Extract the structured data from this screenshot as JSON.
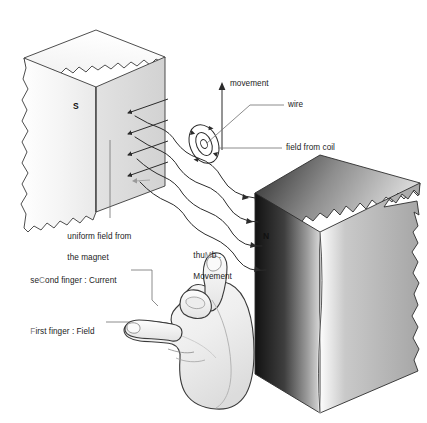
{
  "diagram": {
    "background_color": "#ffffff",
    "ink_color": "#2b2b2b",
    "text_color": "#1c1c1c",
    "highlight_letter_color": "#7d7d7d"
  },
  "magnets": {
    "south": {
      "pole_label": "S",
      "face_color": "#f2f2f2",
      "top_color": "#fbfbfb",
      "side_color": "#e4e4e4",
      "outline_color": "#3a3a3a"
    },
    "north": {
      "pole_label": "N",
      "face_color": "#1a1a1a",
      "top_color": "#6a6a6a",
      "side_color": "#b9b9b9",
      "outline_color": "#2c2c2c"
    }
  },
  "annotations": {
    "movement": "movement",
    "wire": "wire",
    "field_from_coil": "field from coil",
    "uniform_field_line1": "uniform field from",
    "uniform_field_line2": "the magnet"
  },
  "hand_rule": {
    "thumb": {
      "prefix": "thu",
      "highlight": "M",
      "suffix": "b :",
      "line2": "Movement",
      "full": "thuMb : Movement"
    },
    "second_finger": {
      "prefix": "se",
      "highlight": "C",
      "suffix": "ond finger : Current",
      "full": "seCond finger : Current"
    },
    "first_finger": {
      "highlight": "F",
      "suffix": "irst finger : Field",
      "full": "First finger : Field"
    }
  },
  "field_lines": {
    "count": 4,
    "direction": "from N (right) to S (left)",
    "arrow_count_per_line": 2
  },
  "coil": {
    "shape": "concentric-ellipses",
    "ring_count": 2,
    "arrow_markers": 4
  }
}
